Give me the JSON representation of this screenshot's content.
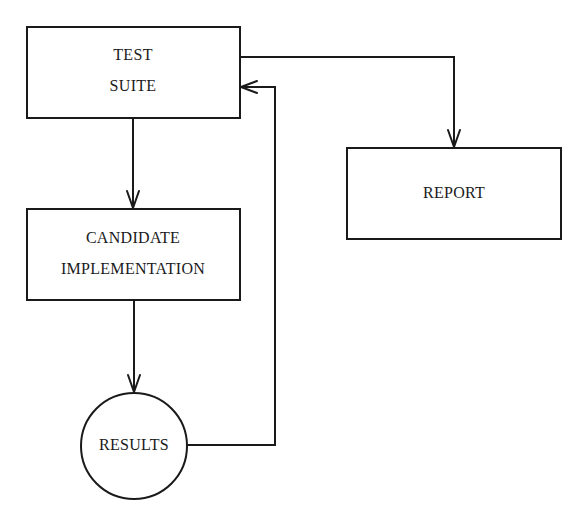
{
  "diagram": {
    "type": "flowchart",
    "colors": {
      "stroke": "#1a1a1a",
      "background": "#ffffff"
    },
    "nodes": {
      "test_suite": {
        "shape": "rectangle",
        "lines": [
          "TEST",
          "SUITE"
        ]
      },
      "candidate": {
        "shape": "rectangle",
        "lines": [
          "CANDIDATE",
          "IMPLEMENTATION"
        ]
      },
      "results": {
        "shape": "circle",
        "lines": [
          "RESULTS"
        ]
      },
      "report": {
        "shape": "rectangle",
        "lines": [
          "REPORT"
        ]
      }
    },
    "edges": [
      {
        "from": "TEST SUITE",
        "to": "CANDIDATE IMPLEMENTATION"
      },
      {
        "from": "CANDIDATE IMPLEMENTATION",
        "to": "RESULTS"
      },
      {
        "from": "RESULTS",
        "to": "TEST SUITE"
      },
      {
        "from": "TEST SUITE",
        "to": "REPORT"
      }
    ]
  }
}
